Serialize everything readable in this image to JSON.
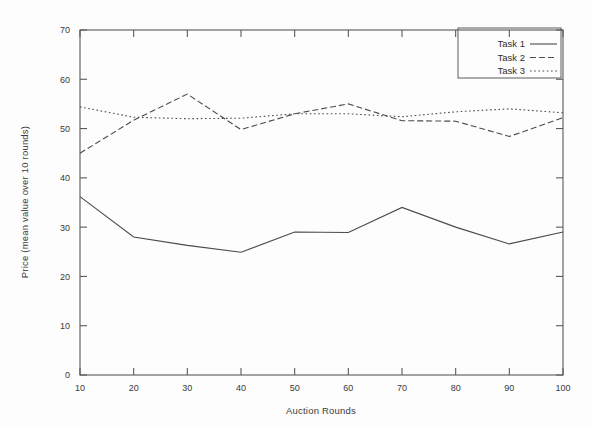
{
  "chart_data": {
    "type": "line",
    "title": "",
    "xlabel": "Auction Rounds",
    "ylabel": "Price (mean value over 10 rounds)",
    "x": [
      10,
      20,
      30,
      40,
      50,
      60,
      70,
      80,
      90,
      100
    ],
    "xlim": [
      10,
      100
    ],
    "ylim": [
      0,
      70
    ],
    "xticks": [
      "10",
      "20",
      "30",
      "40",
      "50",
      "60",
      "70",
      "80",
      "90",
      "100"
    ],
    "yticks": [
      "0",
      "10",
      "20",
      "30",
      "40",
      "50",
      "60",
      "70"
    ],
    "grid": false,
    "legend_position": "top-right",
    "series": [
      {
        "name": "Task 1",
        "style": "solid",
        "values": [
          36.2,
          28.0,
          26.3,
          24.9,
          29.0,
          28.9,
          34.0,
          30.0,
          26.6,
          29.0
        ]
      },
      {
        "name": "Task 2",
        "style": "dashed",
        "values": [
          45.0,
          51.7,
          57.0,
          49.8,
          53.0,
          55.0,
          51.6,
          51.5,
          48.4,
          52.2
        ]
      },
      {
        "name": "Task 3",
        "style": "dotted",
        "values": [
          54.4,
          52.3,
          52.0,
          52.1,
          53.0,
          53.0,
          52.4,
          53.4,
          54.0,
          53.2
        ]
      }
    ]
  },
  "legend": {
    "entries": [
      {
        "label": "Task 1"
      },
      {
        "label": "Task 2"
      },
      {
        "label": "Task 3"
      }
    ]
  },
  "colors": {
    "line": "#4a4a4a",
    "axis": "#5a5a5a",
    "text": "#3a3a3a",
    "background": "#fdfdfd"
  }
}
